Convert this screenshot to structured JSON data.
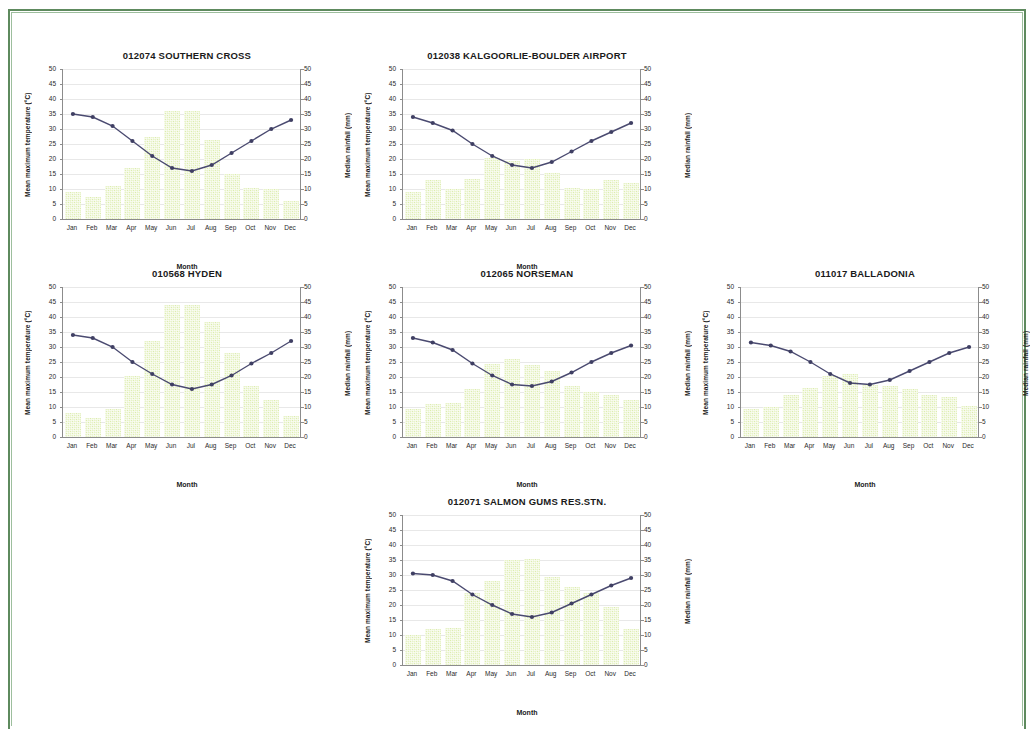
{
  "page": {
    "border_color": "#5e8a5e",
    "background": "#ffffff"
  },
  "axes": {
    "y_left_title": "Mean maximum temperature (°C)",
    "y_right_title": "Median  rainfall  (mm)",
    "x_title": "Month",
    "y_ticks": [
      "50",
      "45",
      "40",
      "35",
      "30",
      "25",
      "20",
      "15",
      "10",
      "5",
      "0"
    ],
    "months": [
      "Jan",
      "Feb",
      "Mar",
      "Apr",
      "May",
      "Jun",
      "Jul",
      "Aug",
      "Sep",
      "Oct",
      "Nov",
      "Dec"
    ],
    "y_min": 0,
    "y_max": 50
  },
  "style": {
    "bar_color": "#dcecae",
    "line_color": "#4a4a70",
    "marker_color": "#3f3f63",
    "axis_color": "#8c8c8c",
    "grid_color": "#e8e8e8"
  },
  "charts": [
    {
      "id": "southern-cross",
      "title": "012074 SOUTHERN CROSS",
      "position": {
        "left": 22,
        "top": 48
      },
      "chart_data": {
        "type": "bar",
        "title": "012074 SOUTHERN CROSS",
        "xlabel": "Month",
        "ylabel": "Mean maximum temperature (°C)",
        "y2label": "Median  rainfall  (mm)",
        "categories": [
          "Jan",
          "Feb",
          "Mar",
          "Apr",
          "May",
          "Jun",
          "Jul",
          "Aug",
          "Sep",
          "Oct",
          "Nov",
          "Dec"
        ],
        "ylim": [
          0,
          50
        ],
        "grid": true,
        "legend": "none",
        "series": [
          {
            "name": "Median rainfall (mm)",
            "type": "bar",
            "axis": "right",
            "values": [
              9,
              7.5,
              11,
              17,
              27.5,
              36,
              36,
              26.5,
              15,
              10.5,
              10,
              6
            ]
          },
          {
            "name": "Mean maximum temperature (°C)",
            "type": "line",
            "axis": "left",
            "values": [
              35,
              34,
              31,
              26,
              21,
              17,
              16,
              18,
              22,
              26,
              30,
              33
            ]
          }
        ]
      }
    },
    {
      "id": "kalgoorlie-boulder-airport",
      "title": "012038 KALGOORLIE-BOULDER AIRPORT",
      "position": {
        "left": 362,
        "top": 48
      },
      "chart_data": {
        "type": "bar",
        "title": "012038 KALGOORLIE-BOULDER AIRPORT",
        "xlabel": "Month",
        "ylabel": "Mean maximum temperature (°C)",
        "y2label": "Median  rainfall  (mm)",
        "categories": [
          "Jan",
          "Feb",
          "Mar",
          "Apr",
          "May",
          "Jun",
          "Jul",
          "Aug",
          "Sep",
          "Oct",
          "Nov",
          "Dec"
        ],
        "ylim": [
          0,
          50
        ],
        "grid": true,
        "legend": "none",
        "series": [
          {
            "name": "Median rainfall (mm)",
            "type": "bar",
            "axis": "right",
            "values": [
              9,
              13,
              10,
              13.5,
              20.5,
              19.5,
              20,
              15.5,
              10.5,
              10,
              13,
              12
            ]
          },
          {
            "name": "Mean maximum temperature (°C)",
            "type": "line",
            "axis": "left",
            "values": [
              34,
              32,
              29.5,
              25,
              21,
              18,
              17,
              19,
              22.5,
              26,
              29,
              32
            ]
          }
        ]
      }
    },
    {
      "id": "hyden",
      "title": "010568 HYDEN",
      "position": {
        "left": 22,
        "top": 266
      },
      "chart_data": {
        "type": "bar",
        "title": "010568 HYDEN",
        "xlabel": "Month",
        "ylabel": "Mean maximum temperature (°C)",
        "y2label": "Median  rainfall  (mm)",
        "categories": [
          "Jan",
          "Feb",
          "Mar",
          "Apr",
          "May",
          "Jun",
          "Jul",
          "Aug",
          "Sep",
          "Oct",
          "Nov",
          "Dec"
        ],
        "ylim": [
          0,
          50
        ],
        "grid": true,
        "legend": "none",
        "series": [
          {
            "name": "Median rainfall (mm)",
            "type": "bar",
            "axis": "right",
            "values": [
              8,
              6.5,
              9.5,
              20.5,
              32,
              44,
              44,
              38.5,
              28,
              17,
              12.5,
              7
            ]
          },
          {
            "name": "Mean maximum temperature (°C)",
            "type": "line",
            "axis": "left",
            "values": [
              34,
              33,
              30,
              25,
              21,
              17.5,
              16,
              17.5,
              20.5,
              24.5,
              28,
              32
            ]
          }
        ]
      }
    },
    {
      "id": "norseman",
      "title": "012065 NORSEMAN",
      "position": {
        "left": 362,
        "top": 266
      },
      "chart_data": {
        "type": "bar",
        "title": "012065 NORSEMAN",
        "xlabel": "Month",
        "ylabel": "Mean maximum temperature (°C)",
        "y2label": "Median  rainfall  (mm)",
        "categories": [
          "Jan",
          "Feb",
          "Mar",
          "Apr",
          "May",
          "Jun",
          "Jul",
          "Aug",
          "Sep",
          "Oct",
          "Nov",
          "Dec"
        ],
        "ylim": [
          0,
          50
        ],
        "grid": true,
        "legend": "none",
        "series": [
          {
            "name": "Median rainfall (mm)",
            "type": "bar",
            "axis": "right",
            "values": [
              9.5,
              11,
              11.5,
              16,
              24.5,
              26,
              24,
              22,
              17,
              15,
              14,
              12.5
            ]
          },
          {
            "name": "Mean maximum temperature (°C)",
            "type": "line",
            "axis": "left",
            "values": [
              33,
              31.5,
              29,
              24.5,
              20.5,
              17.5,
              17,
              18.5,
              21.5,
              25,
              28,
              30.5
            ]
          }
        ]
      }
    },
    {
      "id": "balladonia",
      "title": "011017 BALLADONIA",
      "position": {
        "left": 700,
        "top": 266
      },
      "chart_data": {
        "type": "bar",
        "title": "011017 BALLADONIA",
        "xlabel": "Month",
        "ylabel": "Mean maximum temperature (°C)",
        "y2label": "Median  rainfall  (mm)",
        "categories": [
          "Jan",
          "Feb",
          "Mar",
          "Apr",
          "May",
          "Jun",
          "Jul",
          "Aug",
          "Sep",
          "Oct",
          "Nov",
          "Dec"
        ],
        "ylim": [
          0,
          50
        ],
        "grid": true,
        "legend": "none",
        "series": [
          {
            "name": "Median rainfall (mm)",
            "type": "bar",
            "axis": "right",
            "values": [
              9.5,
              10,
              14,
              16.5,
              20.5,
              21,
              17.5,
              17,
              16,
              14,
              13.5,
              10.5
            ]
          },
          {
            "name": "Mean maximum temperature (°C)",
            "type": "line",
            "axis": "left",
            "values": [
              31.5,
              30.5,
              28.5,
              25,
              21,
              18,
              17.5,
              19,
              22,
              25,
              28,
              30
            ]
          }
        ]
      }
    },
    {
      "id": "salmon-gums-res-stn",
      "title": "012071 SALMON GUMS RES.STN.",
      "position": {
        "left": 362,
        "top": 494
      },
      "chart_data": {
        "type": "bar",
        "title": "012071 SALMON GUMS RES.STN.",
        "xlabel": "Month",
        "ylabel": "Mean maximum temperature (°C)",
        "y2label": "Median  rainfall  (mm)",
        "categories": [
          "Jan",
          "Feb",
          "Mar",
          "Apr",
          "May",
          "Jun",
          "Jul",
          "Aug",
          "Sep",
          "Oct",
          "Nov",
          "Dec"
        ],
        "ylim": [
          0,
          50
        ],
        "grid": true,
        "legend": "none",
        "series": [
          {
            "name": "Median rainfall (mm)",
            "type": "bar",
            "axis": "right",
            "values": [
              10,
              12,
              12.5,
              24,
              28,
              35,
              35.5,
              29.5,
              26,
              24,
              19.5,
              12
            ]
          },
          {
            "name": "Mean maximum temperature (°C)",
            "type": "line",
            "axis": "left",
            "values": [
              30.5,
              30,
              28,
              23.5,
              20,
              17,
              16,
              17.5,
              20.5,
              23.5,
              26.5,
              29
            ]
          }
        ]
      }
    }
  ]
}
